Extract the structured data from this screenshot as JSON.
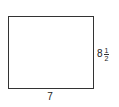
{
  "diagram": {
    "shape": "rectangle",
    "width_label": "7",
    "height_label": {
      "whole": "8",
      "numerator": "1",
      "denominator": "2"
    }
  }
}
